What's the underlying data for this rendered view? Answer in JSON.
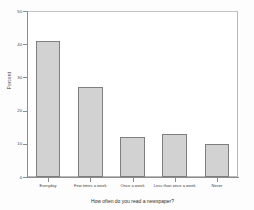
{
  "chart_data": {
    "type": "bar",
    "title": "",
    "xlabel": "How often do you read a newspaper?",
    "ylabel": "Percent",
    "categories": [
      "Everyday",
      "Few times a week",
      "Once a week",
      "Less than once a week",
      "Never"
    ],
    "values": [
      41,
      27,
      12,
      13,
      10
    ],
    "ylim": [
      0,
      50
    ],
    "yticks": [
      0,
      10,
      20,
      30,
      40,
      50
    ],
    "ytick_labels": [
      "0",
      "10",
      "20",
      "30",
      "40",
      "50"
    ],
    "grid": false,
    "legend": "none",
    "bar_fill_color": "#d2d2d2",
    "bar_edge_color": "#7e7e7e",
    "axis_color": "#8c8c8c",
    "background_color": "#ffffff"
  }
}
